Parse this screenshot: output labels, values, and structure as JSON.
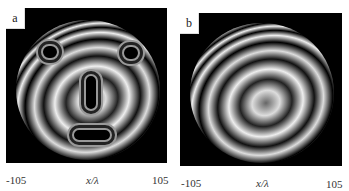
{
  "figure": {
    "panels": [
      {
        "id": "a",
        "label": "a",
        "x_axis": {
          "min_label": "-105",
          "center_label": "x/λ",
          "max_label": "105"
        },
        "overlays": [
          "outlined-region-top-left",
          "outlined-region-top-right",
          "outlined-region-center-vertical",
          "outlined-region-bottom-horizontal"
        ]
      },
      {
        "id": "b",
        "label": "b",
        "x_axis": {
          "min_label": "-105",
          "center_label": "x/λ",
          "max_label": "105"
        },
        "overlays": []
      }
    ],
    "colors": {
      "background": "#000000",
      "fringe": "#ffffff",
      "outline": "#9a9a9a"
    }
  }
}
